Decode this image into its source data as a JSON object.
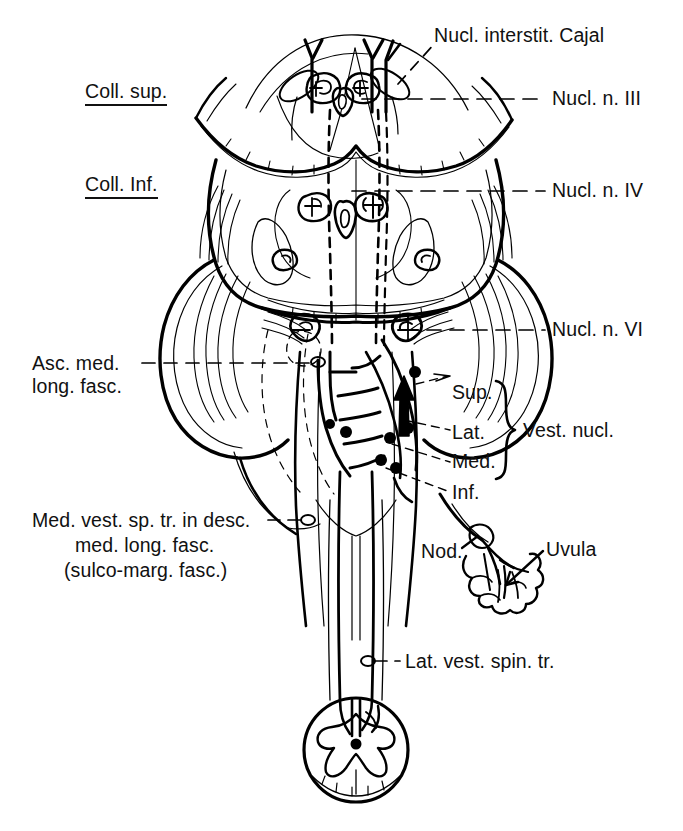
{
  "figure": {
    "kind": "anatomical-line-drawing",
    "background_color": "#ffffff",
    "ink_color": "#000000",
    "width": 683,
    "height": 831
  },
  "labels": {
    "nucl_interstit_cajal": "Nucl. interstit. Cajal",
    "nucl_n_iii": "Nucl. n. III",
    "nucl_n_iv": "Nucl. n. IV",
    "nucl_n_vi": "Nucl. n. VI",
    "coll_sup": "Coll. sup.",
    "coll_inf": "Coll. Inf.",
    "asc_med_long_fasc_line1": "Asc. med.",
    "asc_med_long_fasc_line2": "long. fasc.",
    "med_vest_line1": "Med. vest. sp. tr. in desc.",
    "med_vest_line2": "med. long. fasc.",
    "med_vest_line3": "(sulco-marg. fasc.)",
    "vest_sup": "Sup.",
    "vest_lat": "Lat.",
    "vest_med": "Med.",
    "vest_inf": "Inf.",
    "vest_nucl_group": "Vest. nucl.",
    "nod": "Nod.",
    "uvula": "Uvula",
    "lat_vest_spin_tr": "Lat. vest. spin. tr."
  }
}
